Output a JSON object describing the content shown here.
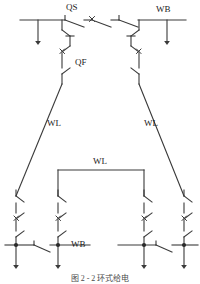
{
  "figure": {
    "title": "图 2 - 2   环式给电",
    "stroke_color": "#3a3a3a",
    "text_color": "#1a1a1a"
  },
  "labels": {
    "qs": "QS",
    "qf": "QF",
    "wb_top": "WB",
    "wl_left": "WL",
    "wl_right": "WL",
    "wl_middle": "WL",
    "wb_bottom": "WB"
  },
  "icons": {
    "disconnect_switch": "disconnect-switch-icon",
    "circuit_breaker": "circuit-breaker-x-icon",
    "load_arrow": "load-arrow-icon",
    "junction_dot": "junction-dot-icon"
  },
  "diagram": {
    "type": "single-line-electrical-schematic",
    "top_busbar": {
      "y": 20,
      "x_start": 20,
      "x_end": 185
    },
    "top_busbar_switches": [
      "QS disconnect",
      "circuit breaker",
      "disconnect"
    ],
    "feeders_top": [
      {
        "x": 38
      },
      {
        "x": 167
      }
    ],
    "risers": [
      {
        "x": 62,
        "label": "QF"
      },
      {
        "x": 139,
        "label": ""
      }
    ],
    "bottom_busbars": [
      {
        "x_start": 5,
        "x_end": 90,
        "y": 245,
        "label": "WB",
        "branches": [
          16,
          58
        ]
      },
      {
        "x_start": 118,
        "x_end": 198,
        "y": 245,
        "label": "",
        "branches": [
          144,
          184
        ]
      }
    ]
  }
}
